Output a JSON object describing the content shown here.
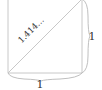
{
  "diagram": {
    "type": "unit-square-diagonal",
    "labels": {
      "diagonal": "1.414…",
      "bottom_side": "1",
      "right_side": "1"
    },
    "colors": {
      "edges": "#c8c8c8",
      "braces": "#b8b8b8",
      "text": "#333333",
      "background": "#ffffff"
    }
  }
}
